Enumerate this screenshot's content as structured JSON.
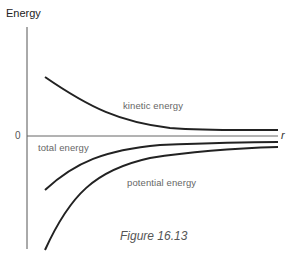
{
  "figure": {
    "caption": "Figure 16.13",
    "y_axis_label": "Energy",
    "x_axis_label": "r",
    "zero_tick": "0"
  },
  "curves": [
    {
      "name": "kinetic energy",
      "label": "kinetic energy",
      "behavior": "positive, decreasing toward 0 as r increases"
    },
    {
      "name": "total energy",
      "label": "total energy",
      "behavior": "negative, increasing toward 0 as r increases"
    },
    {
      "name": "potential energy",
      "label": "potential energy",
      "behavior": "negative (more negative than total), increasing toward 0 as r increases"
    }
  ],
  "colors": {
    "axis": "#555555",
    "curve": "#222222",
    "label": "#666666"
  }
}
